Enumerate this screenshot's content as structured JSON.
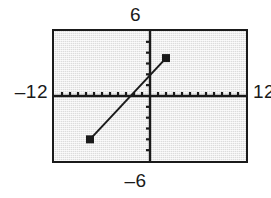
{
  "figure": {
    "name": "graphing-calculator-viewport",
    "window": {
      "xmin_label": "‒12",
      "xmax_label": "12",
      "ymax_label": "6",
      "ymin_label": "‒6"
    },
    "colors": {
      "screen_background": "#dcdcdc",
      "frame": "#1a1a1a",
      "axis": "#1a1a1a",
      "line": "#1a1a1a",
      "label_text": "#1a1a1a",
      "page_background": "#ffffff"
    }
  },
  "chart_data": {
    "type": "line",
    "title": "",
    "xlabel": "",
    "ylabel": "",
    "xlim": [
      -12,
      12
    ],
    "ylim": [
      -6,
      6
    ],
    "xticks": [
      -11,
      -10,
      -9,
      -8,
      -7,
      -6,
      -5,
      -4,
      -3,
      -2,
      -1,
      1,
      2,
      3,
      4,
      5,
      6,
      7,
      8,
      9,
      10,
      11
    ],
    "yticks": [
      -5,
      -4,
      -3,
      -2,
      -1,
      1,
      2,
      3,
      4,
      5
    ],
    "grid": false,
    "legend": null,
    "axes_visible": true,
    "tick_spacing_x": 1,
    "tick_spacing_y": 1,
    "series": [
      {
        "name": "segment",
        "style": "solid-segment-with-square-endpoints",
        "x": [
          -7.5,
          2.0
        ],
        "y": [
          -4.0,
          3.5
        ],
        "endpoints": [
          {
            "label": "left-endpoint",
            "x": -7.5,
            "y": -4.0,
            "marker": "filled-square"
          },
          {
            "label": "right-endpoint",
            "x": 2.0,
            "y": 3.5,
            "marker": "filled-square"
          }
        ],
        "x_intercept": -2.4,
        "y_intercept": 1.9
      }
    ]
  }
}
